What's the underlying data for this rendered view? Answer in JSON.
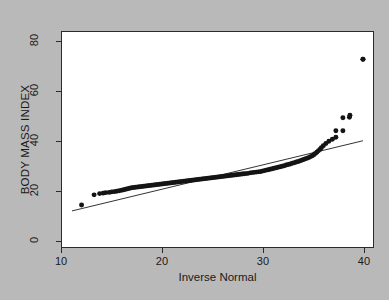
{
  "figure": {
    "background_color": "#b9b9b9",
    "plot_background_color": "#ffffff",
    "frame_color": "#2b2b2b",
    "point_color": "#141414",
    "line_color": "#1a1a1a"
  },
  "chart_data": {
    "type": "scatter",
    "title": "",
    "xlabel": "Inverse Normal",
    "ylabel": "BODY MASS INDEX",
    "xlim": [
      10,
      41
    ],
    "ylim": [
      -3,
      84
    ],
    "xticks": [
      10,
      20,
      30,
      40
    ],
    "xticklabels": [
      "10",
      "20",
      "30",
      "40"
    ],
    "yticks": [
      0,
      20,
      40,
      60,
      80
    ],
    "yticklabels": [
      "0",
      "20",
      "40",
      "60",
      "80"
    ],
    "grid": false,
    "legend": false,
    "reference_line": {
      "name": "identity-line",
      "x": [
        11.0,
        40.0
      ],
      "y": [
        11.6,
        40.0
      ]
    },
    "series": [
      {
        "name": "BMI quantiles",
        "marker": "filled-circle",
        "x": [
          11.95,
          13.2,
          13.75,
          14.1,
          14.35,
          14.7,
          14.95,
          15.2,
          15.45,
          15.7,
          15.95,
          16.15,
          16.35,
          16.55,
          16.75,
          16.95,
          17.15,
          17.35,
          17.55,
          17.75,
          17.95,
          18.15,
          18.35,
          18.55,
          18.75,
          18.95,
          19.15,
          19.35,
          19.55,
          19.75,
          19.95,
          20.15,
          20.35,
          20.55,
          20.75,
          20.95,
          21.15,
          21.35,
          21.55,
          21.75,
          21.95,
          22.15,
          22.35,
          22.55,
          22.75,
          22.95,
          23.15,
          23.35,
          23.55,
          23.75,
          23.95,
          24.15,
          24.35,
          24.55,
          24.75,
          24.95,
          25.15,
          25.35,
          25.55,
          25.75,
          25.95,
          26.15,
          26.35,
          26.55,
          26.75,
          26.95,
          27.15,
          27.35,
          27.55,
          27.75,
          27.95,
          28.15,
          28.35,
          28.55,
          28.75,
          28.95,
          29.15,
          29.35,
          29.55,
          29.75,
          29.95,
          30.15,
          30.35,
          30.55,
          30.75,
          30.95,
          31.15,
          31.35,
          31.55,
          31.75,
          31.95,
          32.15,
          32.35,
          32.55,
          32.75,
          32.95,
          33.15,
          33.35,
          33.55,
          33.75,
          33.95,
          34.15,
          34.35,
          34.55,
          34.75,
          34.95,
          35.1,
          35.25,
          35.4,
          35.55,
          35.7,
          35.85,
          36.05,
          36.3,
          36.6,
          36.95,
          37.3,
          38.0,
          38.65,
          40.0
        ],
        "y": [
          14.0,
          18.1,
          18.6,
          18.8,
          19.0,
          19.1,
          19.3,
          19.4,
          19.6,
          19.8,
          20.0,
          20.2,
          20.4,
          20.6,
          20.8,
          21.0,
          21.1,
          21.2,
          21.3,
          21.4,
          21.5,
          21.6,
          21.7,
          21.8,
          21.9,
          22.0,
          22.1,
          22.2,
          22.3,
          22.4,
          22.5,
          22.6,
          22.7,
          22.8,
          22.9,
          23.0,
          23.1,
          23.2,
          23.3,
          23.4,
          23.5,
          23.6,
          23.7,
          23.8,
          23.9,
          24.0,
          24.1,
          24.2,
          24.3,
          24.4,
          24.5,
          24.6,
          24.7,
          24.8,
          24.9,
          25.0,
          25.1,
          25.2,
          25.3,
          25.4,
          25.5,
          25.6,
          25.7,
          25.8,
          25.9,
          26.0,
          26.1,
          26.2,
          26.3,
          26.4,
          26.5,
          26.6,
          26.7,
          26.8,
          27.0,
          27.1,
          27.2,
          27.3,
          27.4,
          27.5,
          27.7,
          27.9,
          28.1,
          28.3,
          28.5,
          28.7,
          28.9,
          29.1,
          29.3,
          29.5,
          29.7,
          29.9,
          30.2,
          30.4,
          30.6,
          30.9,
          31.1,
          31.4,
          31.6,
          31.9,
          32.2,
          32.5,
          32.8,
          33.1,
          33.5,
          33.9,
          34.3,
          34.8,
          35.3,
          35.9,
          36.5,
          37.2,
          38.0,
          38.9,
          39.8,
          40.6,
          41.4,
          44.0,
          49.5,
          73.0
        ]
      },
      {
        "name": "upper-tail outliers",
        "marker": "filled-circle",
        "x": [
          37.3,
          38.0,
          38.7,
          40.0
        ],
        "y": [
          44.0,
          49.3,
          50.3,
          73.0
        ]
      }
    ]
  }
}
